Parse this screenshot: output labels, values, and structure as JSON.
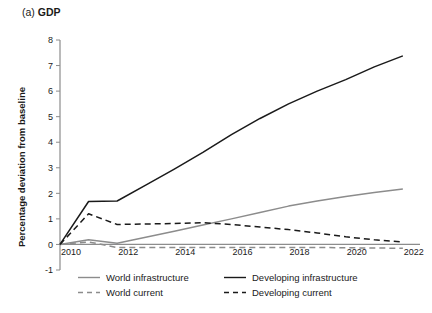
{
  "figure": {
    "panel_tag": "(a)",
    "panel_name": "GDP",
    "ylabel": "Percentage deviation from baseline"
  },
  "colors": {
    "world": "#8c8c8c",
    "developing": "#1a1a1a",
    "axis": "#8c8c8c",
    "text": "#1a1a1a",
    "background": "#ffffff"
  },
  "legend": {
    "items": [
      {
        "label": "World infrastructure",
        "style": "solid",
        "color": "#8c8c8c"
      },
      {
        "label": "Developing infrastructure",
        "style": "solid",
        "color": "#1a1a1a"
      },
      {
        "label": "World current",
        "style": "dashed",
        "color": "#8c8c8c"
      },
      {
        "label": "Developing current",
        "style": "dashed",
        "color": "#1a1a1a"
      }
    ]
  },
  "chart_data": {
    "type": "line",
    "title": "(a) GDP",
    "xlabel": "",
    "ylabel": "Percentage deviation from baseline",
    "xlim": [
      2010,
      2022.6
    ],
    "ylim": [
      -1,
      8
    ],
    "yticks": [
      -1,
      0,
      1,
      2,
      3,
      4,
      5,
      6,
      7,
      8
    ],
    "ytick_labels": [
      "-1",
      "0",
      "1",
      "2",
      "3",
      "4",
      "5",
      "6",
      "7",
      "8"
    ],
    "xticks": [
      2010,
      2012,
      2014,
      2016,
      2018,
      2020,
      2022
    ],
    "xtick_labels": [
      "2010",
      "2012",
      "2014",
      "2016",
      "2018",
      "2020",
      "2022"
    ],
    "grid": false,
    "legend_position": "below",
    "x": [
      2010,
      2011,
      2012,
      2013,
      2014,
      2015,
      2016,
      2017,
      2018,
      2019,
      2020,
      2021,
      2022
    ],
    "series": [
      {
        "name": "World infrastructure",
        "style": "solid",
        "color": "#8c8c8c",
        "values": [
          0.0,
          0.18,
          0.05,
          0.28,
          0.52,
          0.76,
          1.0,
          1.25,
          1.5,
          1.7,
          1.88,
          2.03,
          2.17
        ]
      },
      {
        "name": "Developing infrastructure",
        "style": "solid",
        "color": "#1a1a1a",
        "values": [
          0.0,
          1.68,
          1.7,
          2.32,
          2.95,
          3.6,
          4.3,
          4.93,
          5.5,
          6.0,
          6.45,
          6.95,
          7.38
        ]
      },
      {
        "name": "World current",
        "style": "dashed",
        "color": "#8c8c8c",
        "values": [
          0.0,
          0.1,
          -0.12,
          -0.12,
          -0.12,
          -0.12,
          -0.12,
          -0.12,
          -0.12,
          -0.12,
          -0.13,
          -0.14,
          -0.15
        ]
      },
      {
        "name": "Developing current",
        "style": "dashed",
        "color": "#1a1a1a",
        "values": [
          0.0,
          1.2,
          0.78,
          0.8,
          0.82,
          0.85,
          0.78,
          0.68,
          0.58,
          0.45,
          0.3,
          0.18,
          0.1
        ]
      }
    ]
  }
}
